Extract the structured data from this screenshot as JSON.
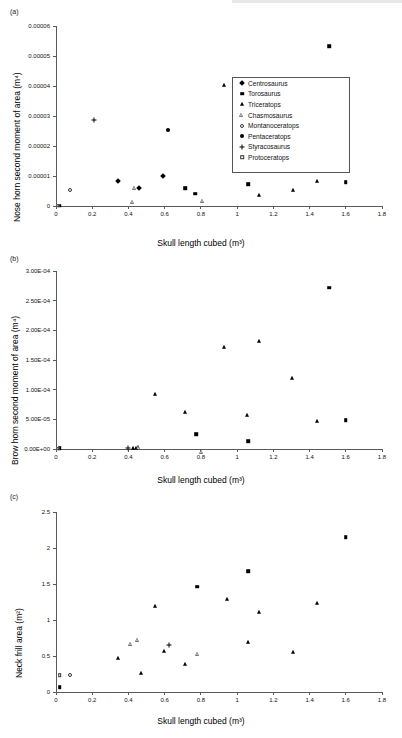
{
  "figure": {
    "panels": [
      "(a)",
      "(b)",
      "(c)"
    ],
    "xlabel": "Skull length cubed (m³)"
  },
  "legend": {
    "entries": [
      {
        "label": "Centrosaurus",
        "marker": "diamond"
      },
      {
        "label": "Torosaurus",
        "marker": "square"
      },
      {
        "label": "Triceratops",
        "marker": "tri"
      },
      {
        "label": "Chasmosaurus",
        "marker": "otri"
      },
      {
        "label": "Montanoceratops",
        "marker": "ocircle"
      },
      {
        "label": "Pentaceratops",
        "marker": "circle"
      },
      {
        "label": "Styracosaurus",
        "marker": "plus"
      },
      {
        "label": "Protoceratops",
        "marker": "osquare"
      }
    ]
  },
  "chart_data": [
    {
      "type": "scatter",
      "panel": "(a)",
      "title": "",
      "xlabel": "Skull length cubed (m³)",
      "ylabel": "Nose horn second moment of area (m⁴)",
      "xlim": [
        0,
        1.8
      ],
      "ylim": [
        0,
        6e-05
      ],
      "xticks": [
        "0",
        "0.2",
        "0.4",
        "0.6",
        "0.8",
        "1",
        "1.2",
        "1.4",
        "1.6",
        "1.8"
      ],
      "yticks": [
        "0",
        "0.00001",
        "0.00002",
        "0.00003",
        "0.00004",
        "0.00005",
        "0.00006"
      ],
      "grid": false,
      "legend_position": "right-upper",
      "series": [
        {
          "name": "Centrosaurus",
          "marker": "diamond",
          "points": [
            [
              0.46,
              6e-06
            ],
            [
              0.59,
              9.9e-06
            ],
            [
              0.34,
              8.5e-06
            ]
          ]
        },
        {
          "name": "Torosaurus",
          "marker": "square",
          "points": [
            [
              1.51,
              5.33e-05
            ],
            [
              1.06,
              7.2e-06
            ],
            [
              1.6,
              8e-06
            ],
            [
              0.77,
              4.1e-06
            ],
            [
              0.715,
              6e-06
            ],
            [
              0.02,
              1e-07
            ]
          ]
        },
        {
          "name": "Triceratops",
          "marker": "tri",
          "points": [
            [
              0.93,
              4.02e-05
            ],
            [
              1.06,
              3.93e-05
            ],
            [
              1.31,
              5.4e-06
            ],
            [
              1.44,
              8.4e-06
            ],
            [
              1.12,
              3.8e-06
            ]
          ]
        },
        {
          "name": "Chasmosaurus",
          "marker": "otri",
          "points": [
            [
              0.435,
              6.1e-06
            ],
            [
              0.425,
              2.6e-06
            ],
            [
              0.81,
              4.3e-06
            ]
          ]
        },
        {
          "name": "Montanoceratops",
          "marker": "ocircle",
          "points": [
            [
              0.075,
              5.3e-06
            ]
          ]
        },
        {
          "name": "Pentaceratops",
          "marker": "circle",
          "points": [
            [
              0.62,
              2.52e-05
            ]
          ]
        },
        {
          "name": "Styracosaurus",
          "marker": "plus",
          "points": [
            [
              0.21,
              2.86e-05
            ]
          ]
        },
        {
          "name": "Protoceratops",
          "marker": "osquare",
          "points": [
            [
              0.01,
              1e-07
            ]
          ]
        }
      ]
    },
    {
      "type": "scatter",
      "panel": "(b)",
      "title": "",
      "xlabel": "Skull length cubed (m³)",
      "ylabel": "Brow horn second moment of area (m⁴)",
      "xlim": [
        0,
        1.8
      ],
      "ylim": [
        0,
        0.0003
      ],
      "xticks": [
        "0",
        "0.2",
        "0.4",
        "0.6",
        "0.8",
        "1",
        "1.2",
        "1.4",
        "1.6",
        "1.8"
      ],
      "yticks": [
        "0.00E+00",
        "5.00E-05",
        "1.00E-04",
        "1.50E-04",
        "2.00E-04",
        "2.50E-04",
        "3.00E-04"
      ],
      "grid": false,
      "legend_position": "none",
      "series": [
        {
          "name": "Triceratops",
          "marker": "tri",
          "points": [
            [
              0.545,
              9.25e-05
            ],
            [
              0.715,
              6.28e-05
            ],
            [
              0.93,
              0.0001718
            ],
            [
              1.12,
              0.0001828
            ],
            [
              1.055,
              5.7e-05
            ],
            [
              1.305,
              0.0001205
            ],
            [
              1.44,
              4.7e-05
            ],
            [
              0.425,
              2e-06
            ],
            [
              0.44,
              2e-06
            ]
          ]
        },
        {
          "name": "Torosaurus",
          "marker": "square",
          "points": [
            [
              1.51,
              0.0002718
            ],
            [
              1.6,
              4.87e-05
            ],
            [
              0.775,
              2.53e-05
            ],
            [
              1.06,
              1.3e-05
            ],
            [
              0.02,
              1e-06
            ]
          ]
        },
        {
          "name": "Chasmosaurus",
          "marker": "otri",
          "points": [
            [
              0.455,
              3e-06
            ],
            [
              0.805,
              2e-06
            ]
          ]
        },
        {
          "name": "Styracosaurus",
          "marker": "plus",
          "points": [
            [
              0.4,
              1e-06
            ]
          ]
        },
        {
          "name": "Protoceratops",
          "marker": "osquare",
          "points": [
            [
              0.01,
              5e-07
            ]
          ]
        }
      ]
    },
    {
      "type": "scatter",
      "panel": "(c)",
      "title": "",
      "xlabel": "Skull length cubed (m³)",
      "ylabel": "Neck frill area (m²)",
      "xlim": [
        0,
        1.8
      ],
      "ylim": [
        0,
        2.5
      ],
      "xticks": [
        "0",
        "0.2",
        "0.4",
        "0.6",
        "0.8",
        "1",
        "1.2",
        "1.4",
        "1.6",
        "1.8"
      ],
      "yticks": [
        "0",
        "0.5",
        "1",
        "1.5",
        "2",
        "2.5"
      ],
      "grid": false,
      "legend_position": "none",
      "series": [
        {
          "name": "Torosaurus",
          "marker": "square",
          "points": [
            [
              1.6,
              2.15
            ],
            [
              1.06,
              1.68
            ],
            [
              0.78,
              1.46
            ],
            [
              0.02,
              0.07
            ]
          ]
        },
        {
          "name": "Triceratops",
          "marker": "tri",
          "points": [
            [
              0.545,
              1.19
            ],
            [
              0.945,
              1.29
            ],
            [
              1.12,
              1.11
            ],
            [
              1.44,
              1.24
            ],
            [
              1.31,
              0.56
            ],
            [
              1.06,
              0.69
            ],
            [
              0.715,
              0.39
            ],
            [
              0.595,
              0.57
            ],
            [
              0.345,
              0.47
            ],
            [
              0.47,
              0.27
            ]
          ]
        },
        {
          "name": "Chasmosaurus",
          "marker": "otri",
          "points": [
            [
              0.41,
              0.67
            ],
            [
              0.45,
              0.78
            ],
            [
              0.78,
              0.64
            ]
          ]
        },
        {
          "name": "Styracosaurus",
          "marker": "plus",
          "points": [
            [
              0.625,
              0.65
            ]
          ]
        },
        {
          "name": "Montanoceratops",
          "marker": "ocircle",
          "points": [
            [
              0.075,
              0.23
            ]
          ]
        },
        {
          "name": "Protoceratops",
          "marker": "osquare",
          "points": [
            [
              0.02,
              0.23
            ]
          ]
        }
      ]
    }
  ]
}
